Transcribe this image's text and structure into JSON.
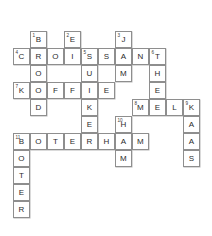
{
  "puzzle": {
    "title": "Crossword Grid",
    "grid": {
      "columns": 12,
      "rows": 11,
      "cell_size_px": 17
    },
    "cells": [
      {
        "col": 1,
        "row": 0,
        "letter": "B",
        "clue": "1"
      },
      {
        "col": 3,
        "row": 0,
        "letter": "E",
        "clue": "2"
      },
      {
        "col": 6,
        "row": 0,
        "letter": "J",
        "clue": "3"
      },
      {
        "col": 0,
        "row": 1,
        "letter": "C",
        "clue": "4"
      },
      {
        "col": 1,
        "row": 1,
        "letter": "R",
        "clue": ""
      },
      {
        "col": 2,
        "row": 1,
        "letter": "O",
        "clue": ""
      },
      {
        "col": 3,
        "row": 1,
        "letter": "I",
        "clue": ""
      },
      {
        "col": 4,
        "row": 1,
        "letter": "S",
        "clue": "5"
      },
      {
        "col": 5,
        "row": 1,
        "letter": "S",
        "clue": ""
      },
      {
        "col": 6,
        "row": 1,
        "letter": "A",
        "clue": ""
      },
      {
        "col": 7,
        "row": 1,
        "letter": "N",
        "clue": ""
      },
      {
        "col": 8,
        "row": 1,
        "letter": "T",
        "clue": "6"
      },
      {
        "col": 1,
        "row": 2,
        "letter": "O",
        "clue": ""
      },
      {
        "col": 4,
        "row": 2,
        "letter": "U",
        "clue": ""
      },
      {
        "col": 6,
        "row": 2,
        "letter": "M",
        "clue": ""
      },
      {
        "col": 8,
        "row": 2,
        "letter": "H",
        "clue": ""
      },
      {
        "col": 0,
        "row": 3,
        "letter": "K",
        "clue": "7"
      },
      {
        "col": 1,
        "row": 3,
        "letter": "O",
        "clue": ""
      },
      {
        "col": 2,
        "row": 3,
        "letter": "F",
        "clue": ""
      },
      {
        "col": 3,
        "row": 3,
        "letter": "F",
        "clue": ""
      },
      {
        "col": 4,
        "row": 3,
        "letter": "I",
        "clue": ""
      },
      {
        "col": 5,
        "row": 3,
        "letter": "E",
        "clue": ""
      },
      {
        "col": 8,
        "row": 3,
        "letter": "E",
        "clue": ""
      },
      {
        "col": 1,
        "row": 4,
        "letter": "D",
        "clue": ""
      },
      {
        "col": 4,
        "row": 4,
        "letter": "K",
        "clue": ""
      },
      {
        "col": 7,
        "row": 4,
        "letter": "M",
        "clue": "8"
      },
      {
        "col": 8,
        "row": 4,
        "letter": "E",
        "clue": ""
      },
      {
        "col": 9,
        "row": 4,
        "letter": "L",
        "clue": ""
      },
      {
        "col": 10,
        "row": 4,
        "letter": "K",
        "clue": "9"
      },
      {
        "col": 4,
        "row": 5,
        "letter": "E",
        "clue": ""
      },
      {
        "col": 6,
        "row": 5,
        "letter": "H",
        "clue": "10"
      },
      {
        "col": 10,
        "row": 5,
        "letter": "A",
        "clue": ""
      },
      {
        "col": 0,
        "row": 6,
        "letter": "B",
        "clue": "11"
      },
      {
        "col": 1,
        "row": 6,
        "letter": "O",
        "clue": ""
      },
      {
        "col": 2,
        "row": 6,
        "letter": "T",
        "clue": ""
      },
      {
        "col": 3,
        "row": 6,
        "letter": "E",
        "clue": ""
      },
      {
        "col": 4,
        "row": 6,
        "letter": "R",
        "clue": ""
      },
      {
        "col": 5,
        "row": 6,
        "letter": "H",
        "clue": ""
      },
      {
        "col": 6,
        "row": 6,
        "letter": "A",
        "clue": ""
      },
      {
        "col": 7,
        "row": 6,
        "letter": "M",
        "clue": ""
      },
      {
        "col": 10,
        "row": 6,
        "letter": "A",
        "clue": ""
      },
      {
        "col": 0,
        "row": 7,
        "letter": "O",
        "clue": ""
      },
      {
        "col": 6,
        "row": 7,
        "letter": "M",
        "clue": ""
      },
      {
        "col": 10,
        "row": 7,
        "letter": "S",
        "clue": ""
      },
      {
        "col": 0,
        "row": 8,
        "letter": "T",
        "clue": ""
      },
      {
        "col": 0,
        "row": 9,
        "letter": "E",
        "clue": ""
      },
      {
        "col": 0,
        "row": 10,
        "letter": "R",
        "clue": ""
      }
    ]
  }
}
